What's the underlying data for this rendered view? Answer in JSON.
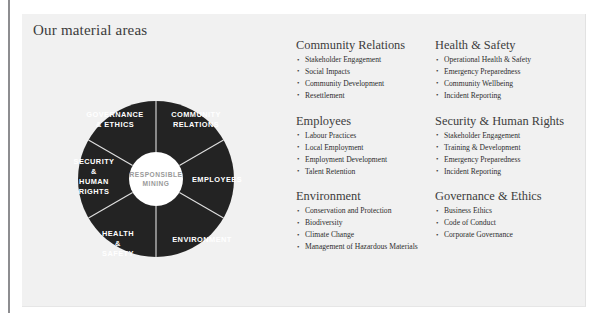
{
  "page": {
    "title": "Our material areas",
    "panel_background": "#f1f1f1",
    "accent_dark": "#232323",
    "divider_color": "#e0e0e0"
  },
  "diagram": {
    "type": "donut",
    "center_label_line1": "RESPONSIBLE",
    "center_label_line2": "MINING",
    "segment_count": 6,
    "segments": [
      {
        "id": "community-relations",
        "lines": [
          "COMMUNITY",
          "RELATIONS"
        ],
        "start_deg": -90,
        "end_deg": -30
      },
      {
        "id": "employees",
        "lines": [
          "EMPLOYEES"
        ],
        "start_deg": -30,
        "end_deg": 30
      },
      {
        "id": "environment",
        "lines": [
          "ENVIRONMENT"
        ],
        "start_deg": 30,
        "end_deg": 90
      },
      {
        "id": "health-safety",
        "lines": [
          "HEALTH",
          "&",
          "SAFETY"
        ],
        "start_deg": 90,
        "end_deg": 150
      },
      {
        "id": "security-human-rights",
        "lines": [
          "SECURITY",
          "&",
          "HUMAN",
          "RIGHTS"
        ],
        "start_deg": 150,
        "end_deg": 210
      },
      {
        "id": "governance-ethics",
        "lines": [
          "GOVERNANCE",
          "& ETHICS"
        ],
        "start_deg": 210,
        "end_deg": 270
      }
    ]
  },
  "columns": [
    {
      "id": "column-left",
      "sections": [
        {
          "id": "community-relations",
          "title": "Community Relations",
          "items": [
            "Stakeholder Engagement",
            "Social Impacts",
            "Community Development",
            "Resettlement"
          ]
        },
        {
          "id": "employees",
          "title": "Employees",
          "items": [
            "Labour Practices",
            "Local Employment",
            "Employment Development",
            "Talent Retention"
          ]
        },
        {
          "id": "environment",
          "title": "Environment",
          "items": [
            "Conservation and Protection",
            "Biodiversity",
            "Climate Change",
            "Management of Hazardous Materials"
          ]
        }
      ]
    },
    {
      "id": "column-right",
      "sections": [
        {
          "id": "health-safety",
          "title": "Health & Safety",
          "items": [
            "Operational Health & Safety",
            "Emergency Preparedness",
            "Community Wellbeing",
            "Incident Reporting"
          ]
        },
        {
          "id": "security-human-rights",
          "title": "Security & Human Rights",
          "items": [
            "Stakeholder Engagement",
            "Training & Development",
            "Emergency Preparedness",
            "Incident Reporting"
          ]
        },
        {
          "id": "governance-ethics",
          "title": "Governance & Ethics",
          "items": [
            "Business Ethics",
            "Code of Conduct",
            "Corporate Governance"
          ]
        }
      ]
    }
  ]
}
